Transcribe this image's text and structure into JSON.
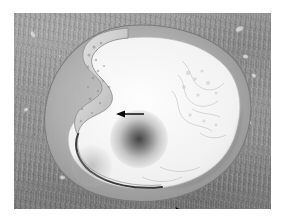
{
  "figure": {
    "domain": "Natural-Image",
    "kind": "light-microscopy-histology-photomicrograph",
    "title": "",
    "caption": "",
    "staining_appearance": "grayscale",
    "plate": {
      "left": 14,
      "top": 13,
      "width": 257,
      "height": 196,
      "background_color": "#9b9b9b",
      "border_color": "#ffffff"
    },
    "palette": {
      "background_white": "#ffffff",
      "adventitia_gray": "#9a9a9a",
      "media_gray": "#8d8d8d",
      "intima_light": "#dedede",
      "lumen_white": "#fbfbfb",
      "internal_elastic_lamina_dark": "#2a2a2a",
      "marker_black": "#000000"
    }
  },
  "regions": [
    {
      "id": "adventitia",
      "label": "Adventitia / surrounding connective tissue",
      "description": "mottled mid-gray fibrous tissue filling the corners of the plate"
    },
    {
      "id": "media",
      "label": "Tunica media",
      "description": "gray band forming the outer rim of the vessel profile"
    },
    {
      "id": "intimal-thickening",
      "label": "Eccentric intimal thickening (plaque)",
      "description": "pale crescent projecting into the lumen at the upper-left notch"
    },
    {
      "id": "lumen",
      "label": "Vessel lumen",
      "description": "large irregular near-white space occupying the center of the section"
    },
    {
      "id": "internal-elastic-lamina",
      "label": "Internal elastic lamina",
      "description": "thin dark line bounding the lower-left aspect of the lumen"
    }
  ],
  "annotations": [
    {
      "id": "arrow",
      "type": "arrow",
      "direction": "left",
      "color": "#000000",
      "x": 101,
      "y": 94,
      "width": 30,
      "height": 14,
      "points_to": "intimal-thickening",
      "label": ""
    },
    {
      "id": "arrowhead",
      "type": "arrowhead",
      "direction": "right",
      "color": "#000000",
      "x": 160,
      "y": 193,
      "width": 14,
      "height": 12,
      "points_to": "media",
      "label": ""
    }
  ],
  "features": [
    {
      "id": "blob-center",
      "label": "Out-of-focus dark inclusion",
      "cx": 125,
      "cy": 126,
      "r": 29,
      "intensity": "dark"
    },
    {
      "id": "blob-lower-left",
      "label": "Faint out-of-focus inclusion",
      "cx": 78,
      "cy": 153,
      "r": 20,
      "intensity": "faint"
    }
  ],
  "vasa_vasorum": [
    {
      "x": 236,
      "y": 27,
      "w": 7,
      "h": 4,
      "rot": -28
    },
    {
      "x": 243,
      "y": 55,
      "w": 5,
      "h": 3,
      "rot": 12
    },
    {
      "x": 252,
      "y": 74,
      "w": 4,
      "h": 3,
      "rot": 40
    },
    {
      "x": 228,
      "y": 96,
      "w": 4,
      "h": 3,
      "rot": -10
    },
    {
      "x": 246,
      "y": 120,
      "w": 5,
      "h": 4,
      "rot": 22
    },
    {
      "x": 30,
      "y": 33,
      "w": 6,
      "h": 3,
      "rot": 58
    },
    {
      "x": 24,
      "y": 108,
      "w": 4,
      "h": 3,
      "rot": -40
    },
    {
      "x": 60,
      "y": 176,
      "w": 5,
      "h": 3,
      "rot": 8
    }
  ]
}
